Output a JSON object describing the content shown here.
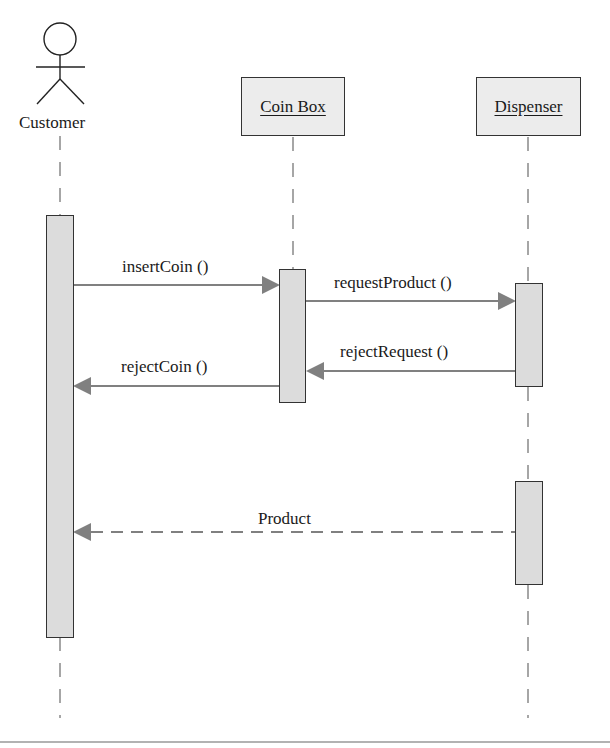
{
  "diagram": {
    "type": "UML sequence diagram",
    "actors": [
      {
        "id": "customer",
        "label": "Customer",
        "kind": "actor"
      }
    ],
    "objects": [
      {
        "id": "coinbox",
        "label": "Coin Box"
      },
      {
        "id": "dispenser",
        "label": "Dispenser"
      }
    ],
    "messages": [
      {
        "from": "Customer",
        "to": "Coin Box",
        "label": "insertCoin ()",
        "style": "solid"
      },
      {
        "from": "Coin Box",
        "to": "Dispenser",
        "label": "requestProduct ()",
        "style": "solid"
      },
      {
        "from": "Dispenser",
        "to": "Coin Box",
        "label": "rejectRequest ()",
        "style": "solid"
      },
      {
        "from": "Coin Box",
        "to": "Customer",
        "label": "rejectCoin ()",
        "style": "solid"
      },
      {
        "from": "Dispenser",
        "to": "Customer",
        "label": "Product",
        "style": "dashed"
      }
    ],
    "colors": {
      "arrow": "#808080",
      "activation_fill": "#dcdcdc",
      "box_fill": "#ececec",
      "outline": "#333333"
    }
  }
}
